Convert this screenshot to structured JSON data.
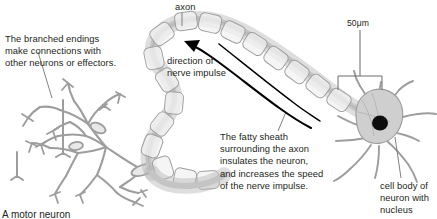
{
  "figure": {
    "title": "A motor neuron",
    "scale_bar": "50μm",
    "labels": {
      "axon": "axon",
      "direction": "direction of\nnerve impulse",
      "branched_endings": "The branched endings\nmake connections with\nother neurons or effectors.",
      "fatty_sheath": "The fatty sheath\nsurrounding the axon\ninsulates the neuron,\nand increases the speed\nof the nerve impulse.",
      "cell_body": "cell body of\nneuron with\nnucleus"
    },
    "colors": {
      "ink": "#231f20",
      "outline": "#9a9a9a",
      "fill_light": "#f0f0f0",
      "fill_mid": "#d0d0d0",
      "fill_sheath": "#c9c9c9",
      "nucleus": "#0d0d0d",
      "arrow": "#000000"
    }
  }
}
